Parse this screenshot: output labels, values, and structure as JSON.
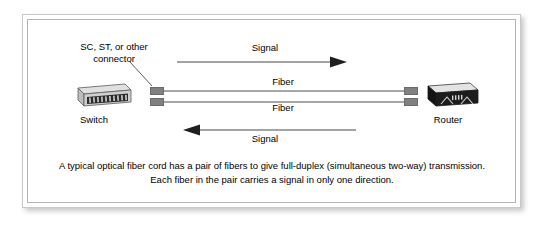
{
  "figure": {
    "type": "network-diagram",
    "title_text": "",
    "caption": {
      "line1": "A typical optical fiber cord has a pair of fibers to give full-duplex (simultaneous two-way) transmission.",
      "line2": "Each fiber in the pair carries a signal in only one direction."
    }
  },
  "annotations": {
    "connector_label_line1": "SC, ST, or other",
    "connector_label_line2": "connector",
    "connector_label_full": "SC, ST, or other connector"
  },
  "devices": [
    {
      "id": "switch",
      "label": "Switch",
      "icon": "network-switch-icon"
    },
    {
      "id": "router",
      "label": "Router",
      "icon": "network-router-icon"
    }
  ],
  "links": [
    {
      "id": "fiber-top",
      "label": "Fiber",
      "signal_label": "Signal",
      "direction": "left-to-right",
      "from": "Switch",
      "to": "Router"
    },
    {
      "id": "fiber-bottom",
      "label": "Fiber",
      "signal_label": "Signal",
      "direction": "right-to-left",
      "from": "Router",
      "to": "Switch"
    }
  ],
  "colors": {
    "background": "#ffffff",
    "frame_border": "#c8c8c8",
    "inner_border": "#b4b4b4",
    "fiber": "#a6a6a6",
    "connector": "#808080",
    "arrow": "#3a3a3a",
    "text": "#000000",
    "switch_body": "#d9d9d9",
    "router_body": "#1a1a1a"
  }
}
